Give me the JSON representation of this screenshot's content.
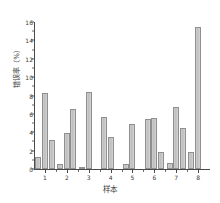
{
  "chart_data": {
    "type": "bar",
    "title": "",
    "xlabel": "样本",
    "ylabel": "错误率（%）",
    "categories": [
      "1",
      "2",
      "3",
      "4",
      "5",
      "6",
      "7",
      "8"
    ],
    "ylim": [
      0,
      16
    ],
    "yticks": [
      0,
      2,
      4,
      6,
      8,
      10,
      12,
      14,
      16
    ],
    "ytick_labels": [
      "0",
      "2",
      "4",
      "6",
      "8",
      "10",
      "12",
      "14",
      "16"
    ],
    "grid": false,
    "legend": "none",
    "bar_color": "#c8c8c8",
    "bar_edge_color": "#8f8f8f",
    "axis_color": "#4a4a4a",
    "series": [
      {
        "name": "系列1",
        "values": [
          1.3,
          0.5,
          0.15,
          5.7,
          0.6,
          5.4,
          0.7,
          1.9
        ]
      },
      {
        "name": "系列2",
        "values": [
          8.3,
          3.9,
          8.35,
          3.5,
          4.9,
          5.6,
          6.8,
          15.5
        ]
      },
      {
        "name": "系列3",
        "values": [
          3.2,
          6.5,
          0.0,
          0.0,
          0.0,
          1.8,
          4.5,
          0.0
        ]
      }
    ]
  }
}
